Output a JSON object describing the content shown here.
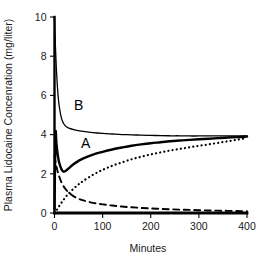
{
  "chart_data": {
    "type": "line",
    "title": "",
    "subtitle": "",
    "xlabel": "Minutes",
    "ylabel": "Plasma Lidocaine Concenration (mg/liter)",
    "xlim": [
      0,
      400
    ],
    "ylim": [
      0,
      10
    ],
    "xticks": [
      "0",
      "100",
      "200",
      "300",
      "400"
    ],
    "xtick_values": [
      0,
      100,
      200,
      300,
      400
    ],
    "yticks": [
      "0",
      "2",
      "4",
      "6",
      "8",
      "10"
    ],
    "ytick_values": [
      0,
      2,
      4,
      6,
      8,
      10
    ],
    "grid": false,
    "legend": "none",
    "frame": "open-left-bottom",
    "annotations": [
      {
        "text": "B",
        "x": 50,
        "y": 5.25
      },
      {
        "text": "A",
        "x": 65,
        "y": 3.3
      }
    ],
    "x": [
      0,
      2,
      4,
      6,
      8,
      10,
      14,
      18,
      22,
      26,
      30,
      40,
      50,
      60,
      80,
      100,
      120,
      140,
      160,
      180,
      200,
      220,
      240,
      260,
      280,
      300,
      320,
      340,
      360,
      380,
      400
    ],
    "series": [
      {
        "name": "B",
        "style": "solid-thin",
        "label": "B",
        "values": [
          10.0,
          8.45,
          7.3,
          6.45,
          5.85,
          5.42,
          4.88,
          4.6,
          4.46,
          4.38,
          4.33,
          4.25,
          4.2,
          4.16,
          4.1,
          4.06,
          4.03,
          4.0,
          3.99,
          3.97,
          3.96,
          3.95,
          3.94,
          3.94,
          3.93,
          3.93,
          3.93,
          3.93,
          3.93,
          3.93,
          3.94
        ]
      },
      {
        "name": "A",
        "style": "solid-thick",
        "label": "A",
        "values": [
          0.2,
          4.0,
          3.55,
          3.1,
          2.78,
          2.55,
          2.26,
          2.12,
          2.13,
          2.2,
          2.29,
          2.5,
          2.66,
          2.79,
          2.98,
          3.12,
          3.24,
          3.34,
          3.43,
          3.5,
          3.56,
          3.61,
          3.66,
          3.7,
          3.73,
          3.76,
          3.79,
          3.82,
          3.85,
          3.87,
          3.9
        ]
      },
      {
        "name": "peripheral-uptake",
        "style": "dotted",
        "label": "",
        "values": [
          0.0,
          0.05,
          0.12,
          0.2,
          0.28,
          0.36,
          0.51,
          0.65,
          0.78,
          0.9,
          1.01,
          1.25,
          1.46,
          1.64,
          1.95,
          2.2,
          2.41,
          2.58,
          2.74,
          2.87,
          2.99,
          3.09,
          3.19,
          3.27,
          3.35,
          3.43,
          3.5,
          3.58,
          3.66,
          3.74,
          3.83
        ]
      },
      {
        "name": "bolus-decay",
        "style": "dashed",
        "label": "",
        "values": [
          2.9,
          2.62,
          2.38,
          2.17,
          1.99,
          1.84,
          1.59,
          1.4,
          1.25,
          1.13,
          1.03,
          0.85,
          0.73,
          0.64,
          0.52,
          0.44,
          0.38,
          0.33,
          0.29,
          0.26,
          0.23,
          0.21,
          0.19,
          0.17,
          0.16,
          0.14,
          0.13,
          0.12,
          0.11,
          0.1,
          0.09
        ]
      }
    ]
  }
}
